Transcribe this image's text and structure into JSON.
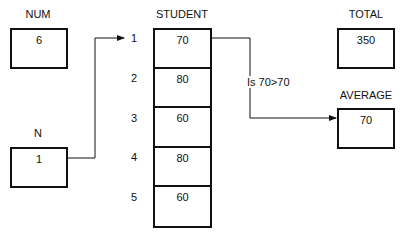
{
  "variables": {
    "num": {
      "label": "NUM",
      "value": "6"
    },
    "n": {
      "label": "N",
      "value": "1"
    },
    "total": {
      "label": "TOTAL",
      "value": "350"
    },
    "average": {
      "label": "AVERAGE",
      "value": "70"
    }
  },
  "student": {
    "label": "STUDENT",
    "rows": [
      {
        "index": "1",
        "value": "70"
      },
      {
        "index": "2",
        "value": "80"
      },
      {
        "index": "3",
        "value": "60"
      },
      {
        "index": "4",
        "value": "80"
      },
      {
        "index": "5",
        "value": "60"
      }
    ]
  },
  "comparison": {
    "text": "Is 70>70"
  }
}
